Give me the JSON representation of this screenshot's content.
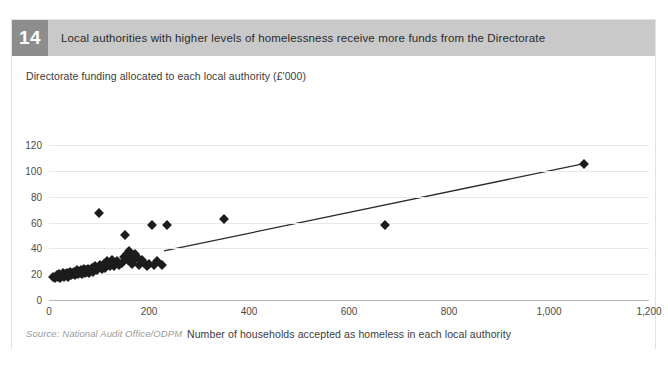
{
  "figure": {
    "number": "14",
    "title": "Local authorities with higher levels of homelessness receive more funds from the Directorate",
    "source": "Source: National Audit Office/ODPM"
  },
  "colors": {
    "header_band": "#c9c9c9",
    "badge": "#8d8d8d",
    "marker": "#1c1c1c",
    "trendline": "#2a2a2a",
    "gridline": "#e8e8e8",
    "axis": "#b9b9b9",
    "source_text": "#9a9a9a"
  },
  "chart_data": {
    "type": "scatter",
    "title": "Local authorities with higher levels of homelessness receive more funds from the Directorate",
    "subtitle": "Directorate funding allocated to each local authority (£'000)",
    "xlabel": "Number of households accepted as homeless in each local authority",
    "ylabel": "Directorate funding allocated to each local authority (£'000)",
    "xlim": [
      0,
      1200
    ],
    "ylim": [
      0,
      120
    ],
    "xticks": [
      0,
      200,
      400,
      600,
      800,
      1000,
      1200
    ],
    "xtick_labels": [
      "0",
      "200",
      "400",
      "600",
      "800",
      "1,000",
      "1,200"
    ],
    "yticks": [
      0,
      20,
      40,
      60,
      80,
      100,
      120
    ],
    "ytick_labels": [
      "0",
      "20",
      "40",
      "60",
      "80",
      "100",
      "120"
    ],
    "grid": true,
    "legend": "none",
    "marker": "diamond",
    "points": [
      [
        8,
        18
      ],
      [
        12,
        17
      ],
      [
        15,
        19
      ],
      [
        18,
        18
      ],
      [
        20,
        20
      ],
      [
        22,
        17
      ],
      [
        25,
        19
      ],
      [
        27,
        21
      ],
      [
        30,
        18
      ],
      [
        32,
        20
      ],
      [
        34,
        19
      ],
      [
        36,
        21
      ],
      [
        38,
        18
      ],
      [
        40,
        20
      ],
      [
        42,
        22
      ],
      [
        44,
        19
      ],
      [
        46,
        21
      ],
      [
        48,
        20
      ],
      [
        50,
        22
      ],
      [
        52,
        19
      ],
      [
        54,
        21
      ],
      [
        56,
        23
      ],
      [
        58,
        20
      ],
      [
        60,
        22
      ],
      [
        62,
        21
      ],
      [
        64,
        23
      ],
      [
        66,
        20
      ],
      [
        68,
        22
      ],
      [
        70,
        24
      ],
      [
        72,
        21
      ],
      [
        74,
        23
      ],
      [
        76,
        22
      ],
      [
        78,
        24
      ],
      [
        80,
        21
      ],
      [
        82,
        23
      ],
      [
        85,
        25
      ],
      [
        88,
        22
      ],
      [
        90,
        24
      ],
      [
        92,
        26
      ],
      [
        95,
        23
      ],
      [
        98,
        25
      ],
      [
        100,
        67
      ],
      [
        102,
        27
      ],
      [
        105,
        24
      ],
      [
        108,
        26
      ],
      [
        110,
        28
      ],
      [
        112,
        25
      ],
      [
        115,
        30
      ],
      [
        118,
        27
      ],
      [
        120,
        29
      ],
      [
        122,
        26
      ],
      [
        125,
        31
      ],
      [
        128,
        28
      ],
      [
        130,
        26
      ],
      [
        135,
        30
      ],
      [
        140,
        27
      ],
      [
        145,
        29
      ],
      [
        150,
        33
      ],
      [
        152,
        50
      ],
      [
        155,
        36
      ],
      [
        158,
        31
      ],
      [
        160,
        38
      ],
      [
        163,
        34
      ],
      [
        165,
        28
      ],
      [
        168,
        30
      ],
      [
        172,
        36
      ],
      [
        175,
        33
      ],
      [
        180,
        27
      ],
      [
        185,
        31
      ],
      [
        190,
        29
      ],
      [
        195,
        26
      ],
      [
        200,
        28
      ],
      [
        205,
        58
      ],
      [
        210,
        27
      ],
      [
        215,
        30
      ],
      [
        225,
        27
      ],
      [
        235,
        58
      ],
      [
        350,
        63
      ],
      [
        672,
        58
      ],
      [
        1070,
        105
      ]
    ],
    "trendline": {
      "label": "linear trend",
      "x": [
        230,
        1075
      ],
      "y": [
        38,
        106
      ]
    }
  }
}
